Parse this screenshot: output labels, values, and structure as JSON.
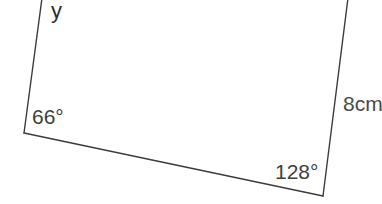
{
  "figure": {
    "kind": "geometry-diagram",
    "background_color": "#ffffff",
    "stroke_color": "#3c3c3c",
    "stroke_width": 1.4,
    "canvas": {
      "width": 382,
      "height": 204
    },
    "vertices": {
      "top_left": {
        "x": 42,
        "y": 0
      },
      "bottom_left": {
        "x": 24,
        "y": 133
      },
      "bottom_right": {
        "x": 323,
        "y": 196
      },
      "top_right": {
        "x": 348,
        "y": 0
      }
    },
    "edges": [
      {
        "name": "left-side",
        "from": "top_left",
        "to": "bottom_left"
      },
      {
        "name": "bottom-side",
        "from": "bottom_left",
        "to": "bottom_right"
      },
      {
        "name": "right-side",
        "from": "bottom_right",
        "to": "top_right"
      }
    ]
  },
  "labels": {
    "unknown_angle": "y",
    "angle_bottom_left": "66°",
    "angle_bottom_right": "128°",
    "side_right": "8cm"
  }
}
